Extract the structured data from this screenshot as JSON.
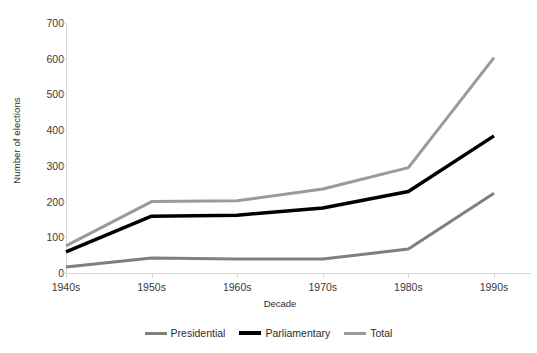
{
  "chart_data": {
    "type": "line",
    "title": "",
    "xlabel": "Decade",
    "ylabel": "Number of elections",
    "categories": [
      "1940s",
      "1950s",
      "1960s",
      "1970s",
      "1980s",
      "1990s"
    ],
    "series": [
      {
        "name": "Presidential",
        "color": "#7f7f7f",
        "width": 3,
        "values": [
          17,
          42,
          39,
          39,
          67,
          223
        ]
      },
      {
        "name": "Parliamentary",
        "color": "#000000",
        "width": 3.5,
        "values": [
          59,
          159,
          162,
          182,
          228,
          384
        ]
      },
      {
        "name": "Total",
        "color": "#9a9a9a",
        "width": 3,
        "values": [
          76,
          200,
          202,
          235,
          295,
          603
        ]
      }
    ],
    "ylim": [
      0,
      700
    ],
    "yticks": [
      0,
      100,
      200,
      300,
      400,
      500,
      600,
      700
    ],
    "ytick_labels": [
      "0",
      "100",
      "200",
      "300",
      "400",
      "500",
      "600",
      "700"
    ],
    "grid": false,
    "legend_position": "bottom",
    "axis_color": "#d7d7d7"
  },
  "legend": {
    "items": [
      {
        "label": "Presidential",
        "color": "#7f7f7f"
      },
      {
        "label": "Parliamentary",
        "color": "#000000"
      },
      {
        "label": "Total",
        "color": "#9a9a9a"
      }
    ]
  }
}
